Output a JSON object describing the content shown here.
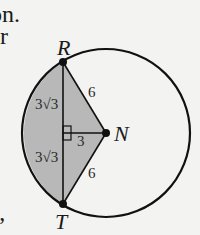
{
  "text_fragments": {
    "line1": "on.",
    "line2": "or",
    "line3": "s,"
  },
  "diagram": {
    "type": "circle-segment-figure",
    "circle": {
      "center": "N",
      "radius": 6
    },
    "points": {
      "R": {
        "label": "R"
      },
      "T": {
        "label": "T"
      },
      "N": {
        "label": "N"
      }
    },
    "lengths": {
      "RN": "6",
      "TN": "6",
      "perp_to_N": "3",
      "upper_half_chord": "3√3",
      "lower_half_chord": "3√3"
    },
    "right_angle_marker": true,
    "colors": {
      "shaded": "#b8b8b8",
      "stroke": "#111111",
      "background": "#f3f3f1"
    }
  }
}
